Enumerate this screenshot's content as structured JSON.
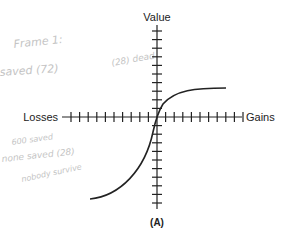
{
  "diagram": {
    "axis_labels": {
      "vertical": "Value",
      "left": "Losses",
      "right": "Gains"
    },
    "panel_label": "(A)",
    "tick_count": {
      "horizontal_left": 10,
      "horizontal_right": 10,
      "vertical_up": 10,
      "vertical_down": 10
    },
    "curve": "S-shaped value function: concave for gains, convex and steeper for losses",
    "handwritten_notes": [
      "Frame 1:",
      "saved (72)",
      "(28) dead",
      "600 saved",
      "none saved (28)",
      "nobody survive"
    ]
  }
}
